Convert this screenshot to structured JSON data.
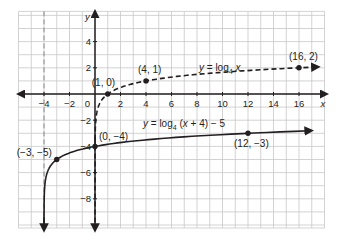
{
  "chart_data": {
    "type": "line",
    "title": "",
    "xlabel": "x",
    "ylabel": "y",
    "xlim": [
      -6,
      18
    ],
    "ylim": [
      -10,
      6
    ],
    "grid": true,
    "x_ticks": [
      -4,
      -2,
      2,
      4,
      6,
      8,
      10,
      12,
      14,
      16
    ],
    "y_ticks": [
      4,
      2,
      -2,
      -4,
      -6,
      -8
    ],
    "origin_label": "0",
    "asymptotes": [
      {
        "x": -4,
        "style": "dashed"
      },
      {
        "x": 0,
        "style": "dashed"
      }
    ],
    "series": [
      {
        "name": "y = log4 x",
        "label": "y = log",
        "base": "4",
        "arg": " x",
        "style": "dashed",
        "points": [
          {
            "x": 1,
            "y": 0,
            "label": "(1, 0)"
          },
          {
            "x": 4,
            "y": 1,
            "label": "(4, 1)"
          },
          {
            "x": 16,
            "y": 2,
            "label": "(16, 2)"
          }
        ]
      },
      {
        "name": "y = log4 (x + 4) − 5",
        "label": "y = log",
        "base": "4",
        "arg": " (x + 4) − 5",
        "style": "solid",
        "points": [
          {
            "x": -3,
            "y": -5,
            "label": "(−3, −5)"
          },
          {
            "x": 0,
            "y": -4,
            "label": "(0, −4)"
          },
          {
            "x": 12,
            "y": -3,
            "label": "(12, −3)"
          }
        ]
      }
    ]
  },
  "colors": {
    "grid": "#c8c8c8",
    "axis": "#231f20",
    "curve": "#231f20"
  }
}
